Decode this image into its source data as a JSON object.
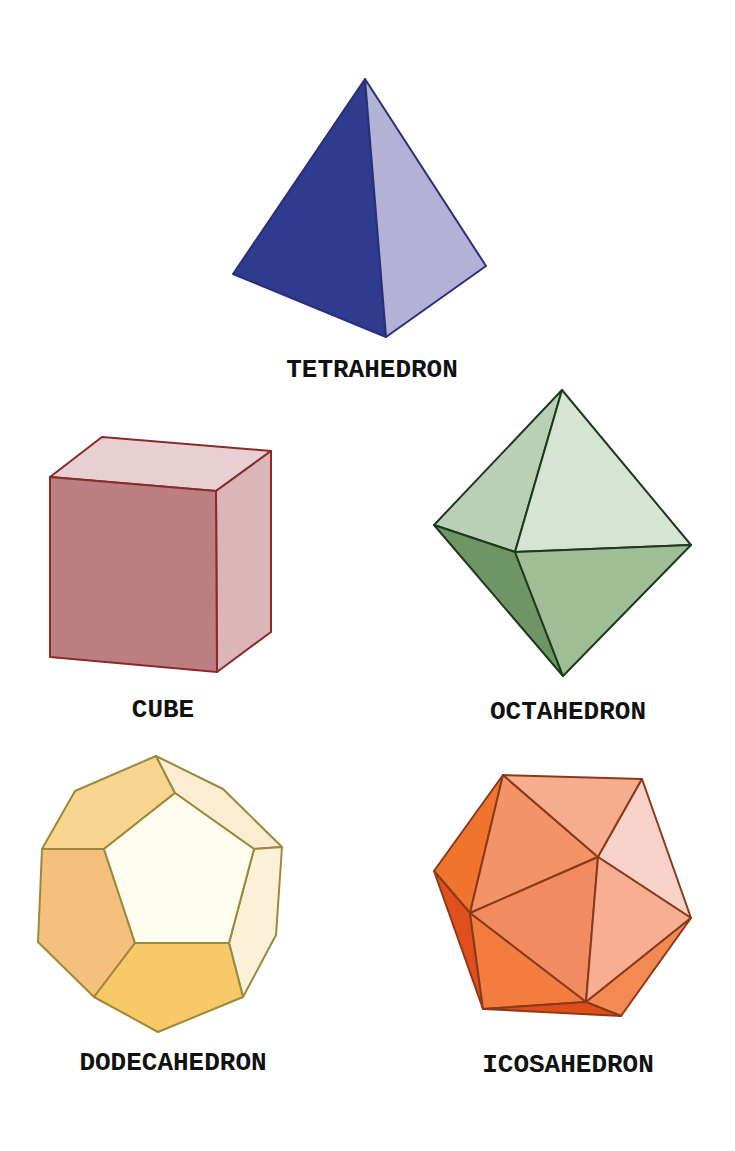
{
  "solids": [
    {
      "id": "tetrahedron",
      "label": "TETRAHEDRON",
      "label_pos": {
        "x": 372,
        "y": 357
      },
      "stroke": "#2a2f7a",
      "faces": [
        {
          "name": "left-face",
          "fill": "#2f3b8c",
          "points": "365,79 233,274 386,337"
        },
        {
          "name": "right-face",
          "fill": "#b4b1d6",
          "points": "365,79 386,337 486,266"
        }
      ]
    },
    {
      "id": "cube",
      "label": "CUBE",
      "label_pos": {
        "x": 163,
        "y": 697
      },
      "stroke": "#8a2a2a",
      "faces": [
        {
          "name": "top-face",
          "fill": "#e8d0d2",
          "points": "50,477 102,437 271,451 216,491"
        },
        {
          "name": "right-face",
          "fill": "#dbb6b9",
          "points": "216,491 271,451 271,632 217,672"
        },
        {
          "name": "front-face",
          "fill": "#bb7e82",
          "points": "50,477 216,491 217,672 50,657"
        }
      ]
    },
    {
      "id": "octahedron",
      "label": "OCTAHEDRON",
      "label_pos": {
        "x": 568,
        "y": 699
      },
      "stroke": "#1e3a1e",
      "faces": [
        {
          "name": "upper-left-face",
          "fill": "#bacfb6",
          "points": "562,390 434,525 515,552"
        },
        {
          "name": "upper-right-face",
          "fill": "#d6e5d3",
          "points": "562,390 515,552 691,545"
        },
        {
          "name": "lower-left-face",
          "fill": "#6e9563",
          "points": "434,525 515,552 563,676"
        },
        {
          "name": "lower-right-face",
          "fill": "#a0be95",
          "points": "515,552 691,545 563,676"
        }
      ]
    },
    {
      "id": "dodecahedron",
      "label": "DODECAHEDRON",
      "label_pos": {
        "x": 173,
        "y": 1050
      },
      "stroke": "#9a8a3a",
      "faces": [
        {
          "name": "top-left-face",
          "fill": "#f9d68f",
          "points": "156,756 175,793 104,849 42,849 75,791"
        },
        {
          "name": "top-right-face",
          "fill": "#fbedd2",
          "points": "156,756 223,789 282,847 254,849 175,793"
        },
        {
          "name": "left-face",
          "fill": "#f5bf7d",
          "points": "42,849 104,849 135,943 94,997 38,942"
        },
        {
          "name": "right-face",
          "fill": "#fbf0d8",
          "points": "254,849 282,847 276,935 243,997 229,943"
        },
        {
          "name": "bottom-face",
          "fill": "#f7c969",
          "points": "135,943 229,943 243,997 158,1032 94,997"
        },
        {
          "name": "front-face",
          "fill": "#fffdf0",
          "points": "175,793 254,849 229,943 135,943 104,849"
        }
      ]
    },
    {
      "id": "icosahedron",
      "label": "ICOSAHEDRON",
      "label_pos": {
        "x": 568,
        "y": 1052
      },
      "stroke": "#8a3a1a",
      "faces": [
        {
          "name": "far-left-face",
          "fill": "#f0742e",
          "points": "503,775 434,871 470,913"
        },
        {
          "name": "left-lower-dark-face",
          "fill": "#e0501c",
          "points": "434,871 470,913 483,1009"
        },
        {
          "name": "upper-left-face",
          "fill": "#f39468",
          "points": "503,775 470,913 598,857"
        },
        {
          "name": "top-face",
          "fill": "#f6ad8e",
          "points": "503,775 642,779 598,857"
        },
        {
          "name": "top-right-face",
          "fill": "#f9d2ca",
          "points": "642,779 598,857 691,918"
        },
        {
          "name": "center-face",
          "fill": "#f28c60",
          "points": "470,913 598,857 586,1002"
        },
        {
          "name": "right-face",
          "fill": "#f7ae92",
          "points": "598,857 691,918 586,1002"
        },
        {
          "name": "bottom-left-face",
          "fill": "#f27d3e",
          "points": "470,913 586,1002 483,1009"
        },
        {
          "name": "bottom-right-face",
          "fill": "#f28a52",
          "points": "586,1002 691,918 621,1016"
        },
        {
          "name": "bottom-edge-face",
          "fill": "#dd4e1a",
          "points": "483,1009 586,1002 621,1016"
        }
      ]
    }
  ]
}
